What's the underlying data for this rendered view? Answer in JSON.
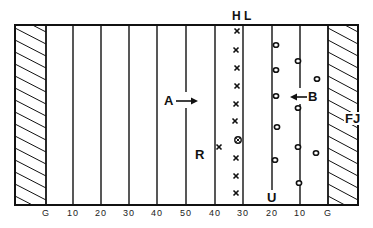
{
  "diagram": {
    "type": "football-field-formation",
    "field": {
      "left": 15,
      "right": 358,
      "top": 25,
      "bottom": 205,
      "left_endzone_right": 46,
      "right_endzone_left": 328
    },
    "yard_lines": [
      {
        "label": "G",
        "x": 46
      },
      {
        "label": "10",
        "x": 73
      },
      {
        "label": "20",
        "x": 101
      },
      {
        "label": "30",
        "x": 129
      },
      {
        "label": "40",
        "x": 157
      },
      {
        "label": "50",
        "x": 186
      },
      {
        "label": "40",
        "x": 215
      },
      {
        "label": "30",
        "x": 243
      },
      {
        "label": "20",
        "x": 272
      },
      {
        "label": "10",
        "x": 300
      },
      {
        "label": "G",
        "x": 328
      }
    ],
    "labels": {
      "head_linesman": "H L",
      "referee": "R",
      "umpire": "U",
      "field_judge": "FJ",
      "team_a": "A",
      "team_b": "B"
    },
    "offense_x": [
      {
        "x": 237,
        "y": 31
      },
      {
        "x": 236,
        "y": 50
      },
      {
        "x": 237,
        "y": 68
      },
      {
        "x": 237,
        "y": 86
      },
      {
        "x": 236,
        "y": 104
      },
      {
        "x": 235,
        "y": 121
      },
      {
        "x": 236,
        "y": 158
      },
      {
        "x": 236,
        "y": 176
      },
      {
        "x": 236,
        "y": 193
      },
      {
        "x": 219,
        "y": 147
      }
    ],
    "center_ball": {
      "x": 238,
      "y": 140
    },
    "defense_o": [
      {
        "x": 276,
        "y": 45
      },
      {
        "x": 276,
        "y": 70
      },
      {
        "x": 276,
        "y": 96
      },
      {
        "x": 277,
        "y": 127
      },
      {
        "x": 275,
        "y": 160
      },
      {
        "x": 298,
        "y": 61
      },
      {
        "x": 298,
        "y": 108
      },
      {
        "x": 298,
        "y": 147
      },
      {
        "x": 299,
        "y": 183
      },
      {
        "x": 317,
        "y": 79
      },
      {
        "x": 316,
        "y": 153
      }
    ],
    "colors": {
      "ink": "#111111",
      "background": "#ffffff"
    }
  }
}
